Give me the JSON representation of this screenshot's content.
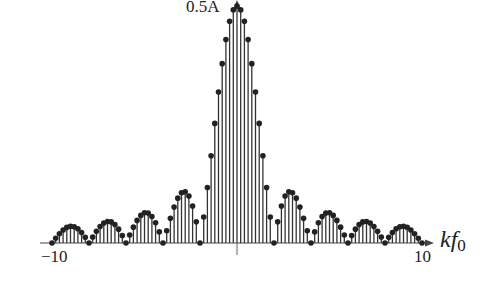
{
  "chart_data": {
    "type": "stem",
    "title": "",
    "xlabel": "kf0",
    "xlabel_main": "kf",
    "xlabel_sub": "0",
    "ylabel": "",
    "peak_label": "0.5A",
    "x_ticks": [
      "-10",
      "10"
    ],
    "xlim": [
      -10,
      10
    ],
    "ylim": [
      0,
      0.5
    ],
    "sample_spacing": 0.2,
    "envelope": "0.5A * |sin(pi*f/2)/(pi*f/2)|",
    "zero_crossings": [
      -10,
      -8,
      -6,
      -4,
      -2,
      2,
      4,
      6,
      8,
      10
    ],
    "peak": {
      "x": 0,
      "y": 0.5
    },
    "grid": false,
    "legend": null,
    "colors": {
      "stem": "#333333",
      "marker": "#222222",
      "axis": "#444444"
    }
  },
  "labels": {
    "peak": "0.5A",
    "tick_left": "−10",
    "tick_right": "10",
    "axis_main": "kf",
    "axis_sub": "0"
  }
}
